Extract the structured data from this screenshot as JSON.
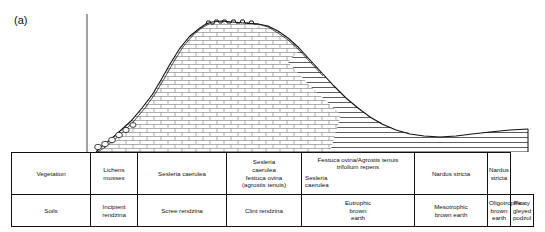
{
  "figure": {
    "panel_label": "(a)",
    "caption_present": false
  },
  "diagram": {
    "type": "geological-cross-section",
    "surface_profile_note": "Ground surface rises steeply from left across a scree slope to a crenellated limestone pavement summit, then descends to a shallow concave basin on the right",
    "lithologies": [
      {
        "name": "limestone",
        "pattern": "brick",
        "position": "core of the hill beneath the summit and both flanks"
      },
      {
        "name": "drift / head deposit",
        "pattern": "horizontal-hatch-band",
        "position": "diagonal band mantling the right-hand limestone flank"
      },
      {
        "name": "shale",
        "pattern": "horizontal-hatch",
        "position": "right-hand low ground beneath the basin"
      },
      {
        "name": "scree",
        "pattern": "small-circles",
        "position": "foot of the left slope"
      }
    ],
    "axis": {
      "vertical_line_present": true,
      "ticks": false,
      "tick_labels": []
    }
  },
  "table": {
    "rows": [
      {
        "header": "Vegetation",
        "cells": [
          {
            "text": "Lichens\nmosses"
          },
          {
            "text": "Sesleria caerulea"
          },
          {
            "text": "Sesleria\ncaerulea\nfestuca ovina\n(agrostis tenuis)"
          },
          {
            "text_top": "Festuca ovina/Agrostis tenuis\ntrifolium repens",
            "text_bottom": "Sesleria\ncaerulea"
          },
          {
            "text": "Nardus stricta"
          },
          {
            "text": "Nardus stricta"
          }
        ]
      },
      {
        "header": "Soils",
        "cells": [
          {
            "text": "Incipient\nrendzina"
          },
          {
            "text": "Scree rendzina"
          },
          {
            "text": "Clint rendzina"
          },
          {
            "text": "Eutrophic\nbrown\nearth"
          },
          {
            "text": "Mesotrophic\nbrown earth"
          },
          {
            "text": "Oligotrophic\nbrown earth"
          },
          {
            "text": "Peaty gleyed\npodzol"
          }
        ]
      }
    ]
  },
  "colors": {
    "ink": "#111111",
    "background": "#ffffff",
    "pattern_line": "#555555"
  }
}
